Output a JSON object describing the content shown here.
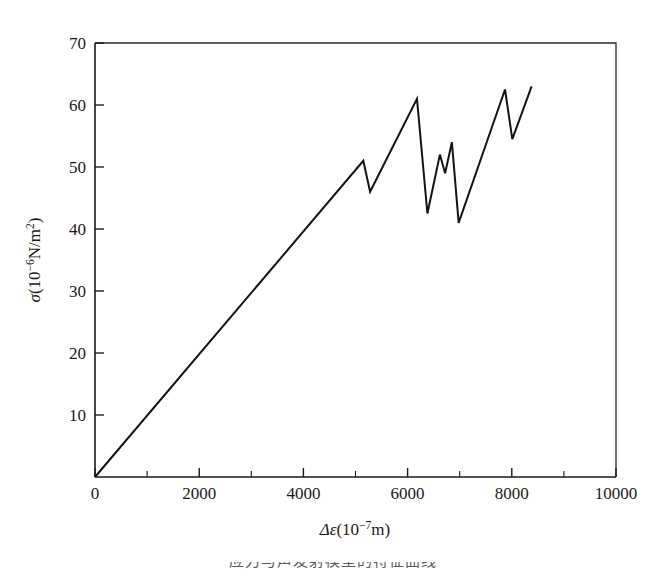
{
  "figure": {
    "background_color": "#ffffff",
    "line_color": "#141414",
    "axis_color": "#1a1a1a",
    "caption_partial": "应力与声发射模型的特征曲线"
  },
  "axes": {
    "x": {
      "title_symbol": "Δε",
      "title_unit_open": "(10",
      "title_unit_exp": "−7",
      "title_unit_close": "m)",
      "title_full": "Δε(10−7m)",
      "ticks": [
        "0",
        "2000",
        "4000",
        "6000",
        "8000",
        "10000"
      ],
      "tick_values": [
        0,
        2000,
        4000,
        6000,
        8000,
        10000
      ],
      "minor_tick_values": [
        1000,
        3000,
        5000,
        7000,
        9000
      ],
      "range": [
        0,
        10000
      ]
    },
    "y": {
      "title_symbol": "σ",
      "title_unit_open": "(10",
      "title_unit_exp": "−6",
      "title_unit_mid": "N/m",
      "title_unit_exp2": "2",
      "title_unit_close": ")",
      "title_full": "σ(10−6N/m2)",
      "ticks": [
        "10",
        "20",
        "30",
        "40",
        "50",
        "60",
        "70"
      ],
      "tick_values": [
        10,
        20,
        30,
        40,
        50,
        60,
        70
      ],
      "range": [
        0,
        70
      ]
    }
  },
  "chart_data": {
    "type": "line",
    "title": "",
    "subtitle": "",
    "xlabel": "Δε(10−7m)",
    "ylabel": "σ(10−6N/m2)",
    "xlim": [
      0,
      10000
    ],
    "ylim": [
      0,
      70
    ],
    "xticks": [
      0,
      2000,
      4000,
      6000,
      8000,
      10000
    ],
    "yticks": [
      10,
      20,
      30,
      40,
      50,
      60,
      70
    ],
    "xticklabels": [
      "0",
      "2000",
      "4000",
      "6000",
      "8000",
      "10000"
    ],
    "yticklabels": [
      "10",
      "20",
      "30",
      "40",
      "50",
      "60",
      "70"
    ],
    "grid": false,
    "legend": false,
    "legend_position": "none",
    "series": [
      {
        "name": "stress-strain",
        "color": "#141414",
        "linewidth": 2.0,
        "x": [
          0,
          5150,
          5280,
          6180,
          6380,
          6620,
          6720,
          6850,
          6980,
          7870,
          8010,
          8380
        ],
        "y": [
          0,
          51.0,
          46.0,
          61.0,
          42.5,
          52.0,
          49.0,
          54.0,
          41.0,
          62.5,
          54.5,
          63.0
        ]
      }
    ],
    "annotations": []
  }
}
